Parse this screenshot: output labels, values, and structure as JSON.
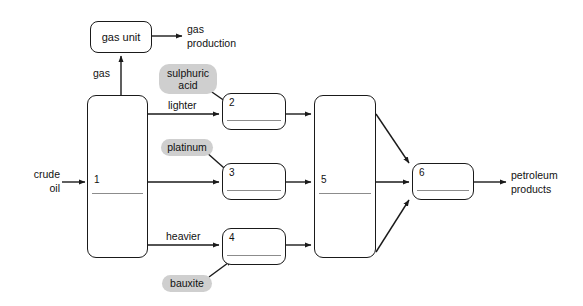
{
  "diagram": {
    "background_color": "#ffffff",
    "line_color": "#1a1a1a",
    "chip_color": "#cfcfcf",
    "rule_color": "#8c8c8c"
  },
  "io": {
    "crude_oil": "crude\noil",
    "crude_oil_line1": "crude",
    "crude_oil_line2": "oil",
    "gas_production_line1": "gas",
    "gas_production_line2": "production",
    "petroleum_products_line1": "petroleum",
    "petroleum_products_line2": "products"
  },
  "units": {
    "gas_unit_label": "gas unit"
  },
  "nodes": [
    {
      "id": "node-1",
      "number": "1"
    },
    {
      "id": "node-2",
      "number": "2"
    },
    {
      "id": "node-3",
      "number": "3"
    },
    {
      "id": "node-4",
      "number": "4"
    },
    {
      "id": "node-5",
      "number": "5"
    },
    {
      "id": "node-6",
      "number": "6"
    }
  ],
  "chips": [
    {
      "id": "chip-sulphuric-acid",
      "label": "sulphuric\nacid",
      "line1": "sulphuric",
      "line2": "acid"
    },
    {
      "id": "chip-platinum",
      "label": "platinum"
    },
    {
      "id": "chip-bauxite",
      "label": "bauxite"
    }
  ],
  "flow_labels": {
    "gas": "gas",
    "lighter": "lighter",
    "heavier": "heavier"
  }
}
